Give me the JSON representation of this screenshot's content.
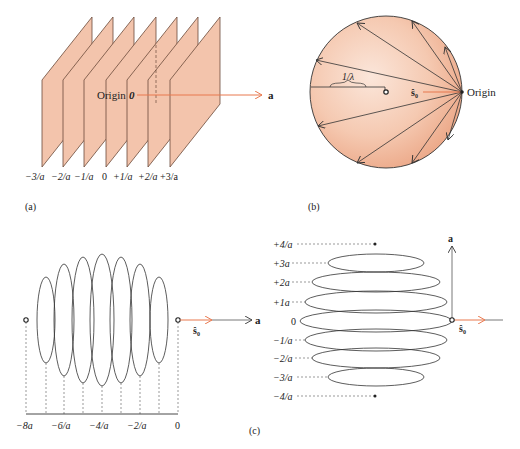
{
  "figure": {
    "panel_a": {
      "caption": "(a)",
      "origin_label": "Origin",
      "origin_symbol": "0",
      "axis_label": "a",
      "plane_labels": [
        "−3/a",
        "−2/a",
        "−1/a",
        "0",
        "+1/a",
        "+2/a",
        "+3/a"
      ],
      "plane_color": "#f3c4ac",
      "arrow_color": "#e8794f"
    },
    "panel_b": {
      "caption": "(b)",
      "radius_label": "1/λ",
      "vector_label": "ŝ₀",
      "origin_label": "Origin",
      "sphere_color": "#f0b595"
    },
    "panel_c": {
      "caption": "(c)",
      "left": {
        "axis_label": "a",
        "vector_label": "ŝ₀",
        "tick_labels": [
          "−8a",
          "−6/a",
          "−4/a",
          "−2/a",
          "0"
        ]
      },
      "right": {
        "axis_label": "a",
        "vector_label": "ŝ₀",
        "level_labels": [
          "+4/a",
          "+3a",
          "+2a",
          "+1a",
          "0",
          "−1/a",
          "−2/a",
          "−3/a",
          "−4/a"
        ]
      }
    }
  }
}
